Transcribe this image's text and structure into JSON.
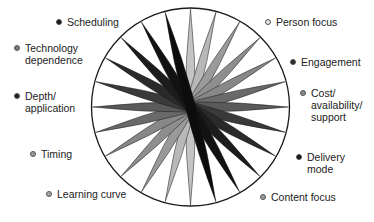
{
  "diagram": {
    "type": "radial-spindle-wheel",
    "center": {
      "x": 190.5,
      "y": 107
    },
    "radius": 99,
    "spindles": [
      {
        "angle": 90,
        "color": "#c4c4c4"
      },
      {
        "angle": 75,
        "color": "#b8b8b8"
      },
      {
        "angle": 60,
        "color": "#9a9a9a"
      },
      {
        "angle": 45,
        "color": "#8e8e8e"
      },
      {
        "angle": 30,
        "color": "#888888"
      },
      {
        "angle": 15,
        "color": "#6a6a6a"
      },
      {
        "angle": 0,
        "color": "#5a5a5a"
      },
      {
        "angle": -15,
        "color": "#3a3a3a"
      },
      {
        "angle": -30,
        "color": "#2a2a2a"
      },
      {
        "angle": -45,
        "color": "#1c1c1c"
      },
      {
        "angle": -60,
        "color": "#121212"
      },
      {
        "angle": -75,
        "color": "#0c0c0c"
      }
    ]
  },
  "legend": [
    {
      "id": "scheduling",
      "label": "Scheduling",
      "dot": "#151515",
      "x": 56,
      "y": 16
    },
    {
      "id": "technology-dependence",
      "label": "Technology\ndependence",
      "dot": "#7a7a7a",
      "x": 14,
      "y": 42
    },
    {
      "id": "depth-application",
      "label": "Depth/\napplication",
      "dot": "#202020",
      "x": 14,
      "y": 90
    },
    {
      "id": "timing",
      "label": "Timing",
      "dot": "#9a9a9a",
      "x": 30,
      "y": 148
    },
    {
      "id": "learning-curve",
      "label": "Learning curve",
      "dot": "#a8a8a8",
      "x": 46,
      "y": 188
    },
    {
      "id": "person-focus",
      "label": "Person focus",
      "dot": "#e6e6e6",
      "x": 265,
      "y": 16
    },
    {
      "id": "engagement",
      "label": "Engagement",
      "dot": "#2a2a2a",
      "x": 290,
      "y": 56
    },
    {
      "id": "cost-availability-support",
      "label": "Cost/\navailability/\nsupport",
      "dot": "#8a8a8a",
      "x": 300,
      "y": 87
    },
    {
      "id": "delivery-mode",
      "label": "Delivery\nmode",
      "dot": "#151515",
      "x": 296,
      "y": 151
    },
    {
      "id": "content-focus",
      "label": "Content focus",
      "dot": "#9a9a9a",
      "x": 260,
      "y": 191
    }
  ]
}
